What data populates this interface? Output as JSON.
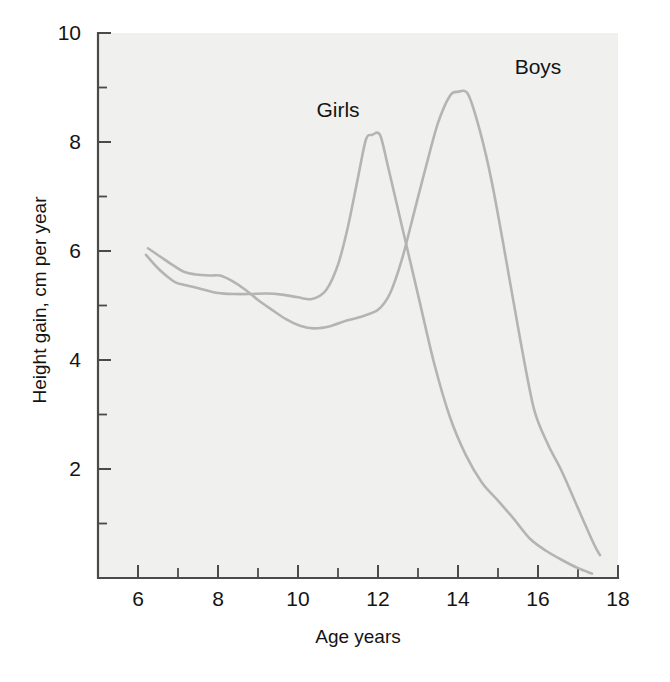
{
  "chart_data": {
    "type": "line",
    "title": "",
    "subtitle": "",
    "xlabel": "Age years",
    "ylabel": "Height gain, cm per year",
    "xlim": [
      5,
      18
    ],
    "ylim": [
      0,
      10
    ],
    "grid": false,
    "legend_position": "inline-annotations",
    "x_ticks_major": [
      6,
      8,
      10,
      12,
      14,
      16,
      18
    ],
    "x_ticks_all": [
      5,
      6,
      7,
      8,
      9,
      10,
      11,
      12,
      13,
      14,
      15,
      16,
      17,
      18
    ],
    "x_tick_labels": [
      "6",
      "8",
      "10",
      "12",
      "14",
      "16",
      "18"
    ],
    "y_ticks_major": [
      2,
      4,
      6,
      8,
      10
    ],
    "y_ticks_all": [
      0,
      1,
      2,
      3,
      4,
      5,
      6,
      7,
      8,
      9,
      10
    ],
    "y_tick_labels": [
      "2",
      "4",
      "6",
      "8",
      "10"
    ],
    "annotations": [
      {
        "text": "Girls",
        "x": 11.0,
        "y": 8.45
      },
      {
        "text": "Boys",
        "x": 16.0,
        "y": 9.25
      }
    ],
    "series": [
      {
        "name": "Girls",
        "color": "#b4b4b4",
        "points": [
          [
            6.2,
            5.93
          ],
          [
            6.45,
            5.72
          ],
          [
            6.7,
            5.55
          ],
          [
            6.95,
            5.42
          ],
          [
            7.2,
            5.37
          ],
          [
            7.6,
            5.3
          ],
          [
            8.0,
            5.23
          ],
          [
            8.4,
            5.21
          ],
          [
            8.8,
            5.21
          ],
          [
            9.2,
            5.22
          ],
          [
            9.6,
            5.2
          ],
          [
            10.0,
            5.15
          ],
          [
            10.35,
            5.12
          ],
          [
            10.7,
            5.28
          ],
          [
            11.0,
            5.75
          ],
          [
            11.25,
            6.45
          ],
          [
            11.5,
            7.35
          ],
          [
            11.7,
            8.05
          ],
          [
            11.85,
            8.13
          ],
          [
            12.05,
            8.13
          ],
          [
            12.25,
            7.55
          ],
          [
            12.6,
            6.45
          ],
          [
            13.0,
            5.2
          ],
          [
            13.4,
            3.95
          ],
          [
            13.8,
            2.95
          ],
          [
            14.2,
            2.25
          ],
          [
            14.6,
            1.75
          ],
          [
            15.0,
            1.42
          ],
          [
            15.4,
            1.08
          ],
          [
            15.8,
            0.72
          ],
          [
            16.2,
            0.5
          ],
          [
            16.6,
            0.33
          ],
          [
            17.0,
            0.18
          ],
          [
            17.35,
            0.08
          ]
        ]
      },
      {
        "name": "Boys",
        "color": "#b4b4b4",
        "points": [
          [
            6.25,
            6.05
          ],
          [
            6.55,
            5.9
          ],
          [
            6.85,
            5.75
          ],
          [
            7.15,
            5.62
          ],
          [
            7.45,
            5.57
          ],
          [
            7.8,
            5.55
          ],
          [
            8.05,
            5.55
          ],
          [
            8.35,
            5.45
          ],
          [
            8.7,
            5.28
          ],
          [
            9.0,
            5.1
          ],
          [
            9.35,
            4.92
          ],
          [
            9.7,
            4.75
          ],
          [
            10.05,
            4.63
          ],
          [
            10.4,
            4.58
          ],
          [
            10.8,
            4.62
          ],
          [
            11.2,
            4.72
          ],
          [
            11.6,
            4.8
          ],
          [
            12.0,
            4.92
          ],
          [
            12.3,
            5.22
          ],
          [
            12.6,
            5.85
          ],
          [
            12.9,
            6.7
          ],
          [
            13.2,
            7.55
          ],
          [
            13.5,
            8.35
          ],
          [
            13.8,
            8.85
          ],
          [
            14.0,
            8.92
          ],
          [
            14.25,
            8.88
          ],
          [
            14.55,
            8.2
          ],
          [
            14.85,
            7.25
          ],
          [
            15.2,
            5.85
          ],
          [
            15.55,
            4.4
          ],
          [
            15.9,
            3.1
          ],
          [
            16.25,
            2.45
          ],
          [
            16.6,
            1.95
          ],
          [
            17.0,
            1.28
          ],
          [
            17.4,
            0.62
          ],
          [
            17.55,
            0.42
          ]
        ]
      }
    ]
  },
  "axes": {
    "x_axis_name": "Age years",
    "y_axis_name": "Height gain, cm per year"
  }
}
